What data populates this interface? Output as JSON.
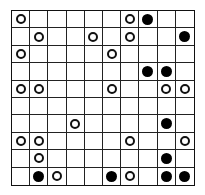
{
  "board": {
    "rows": 10,
    "cols": 10,
    "legend": {
      "O": "white-circle",
      "X": "black-circle",
      ".": "empty"
    },
    "grid": [
      "O.....OX..",
      ".O..O.O..X",
      "O....O....",
      ".......XX.",
      "OO...O..OO",
      "..........",
      "...O....X.",
      "OO....O..O",
      ".O......X.",
      ".XO..XO.XX"
    ],
    "colors": {
      "grid_line": "#222222",
      "background": "#ffffff",
      "black_stone": "#000000",
      "white_stone_border": "#111111"
    }
  }
}
